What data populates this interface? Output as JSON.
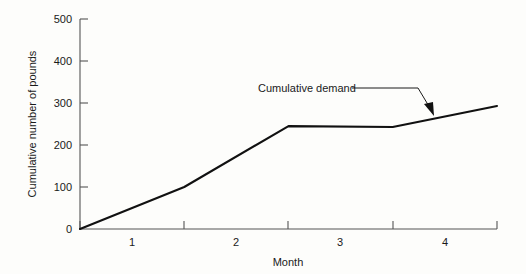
{
  "chart_data": {
    "type": "line",
    "title": "",
    "xlabel": "Month",
    "ylabel": "Cumulative number of pounds",
    "xlim": [
      0.5,
      4.5
    ],
    "ylim": [
      0,
      500
    ],
    "grid": false,
    "legend_position": "none",
    "x_tick_values": [
      0.5,
      1.5,
      2.5,
      3.5,
      4.5
    ],
    "x_tick_labels": [
      "1",
      "2",
      "3",
      "4"
    ],
    "x_tick_label_positions": [
      1,
      2,
      3,
      4
    ],
    "y_tick_labels": [
      "0",
      "100",
      "200",
      "300",
      "400",
      "500"
    ],
    "y_tick_values": [
      0,
      100,
      200,
      300,
      400,
      500
    ],
    "series": [
      {
        "name": "Cumulative demand",
        "x": [
          0.5,
          1.5,
          2.5,
          3.5,
          4.5
        ],
        "values": [
          0,
          100,
          245,
          243,
          293
        ]
      }
    ],
    "annotations": [
      {
        "text": "Cumulative demand",
        "target_x": 3.68,
        "target_y": 258
      }
    ]
  },
  "axes": {
    "y_ticks": [
      {
        "label": "500"
      },
      {
        "label": "400"
      },
      {
        "label": "300"
      },
      {
        "label": "200"
      },
      {
        "label": "100"
      },
      {
        "label": "0"
      }
    ],
    "x_ticks": [
      {
        "label": "1"
      },
      {
        "label": "2"
      },
      {
        "label": "3"
      },
      {
        "label": "4"
      }
    ],
    "x_title": "Month",
    "y_title": "Cumulative number of pounds"
  },
  "annotation": {
    "label": "Cumulative demand"
  },
  "style": {
    "line_color": "#111111",
    "axis_color": "#555555",
    "text_color": "#1a1a1a",
    "background": "#fdfdfb"
  }
}
